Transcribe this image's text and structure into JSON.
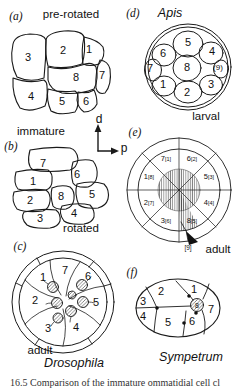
{
  "panel_a": {
    "tag": "(a)",
    "title": "pre-rotated",
    "cells": {
      "n1": "1",
      "n2": "2",
      "n3": "3",
      "n4": "4",
      "n5": "5",
      "n6": "6",
      "n7": "7",
      "n8": "8"
    }
  },
  "axis": {
    "d": "d",
    "p": "p"
  },
  "panel_b": {
    "tag": "(b)",
    "title": "immature",
    "state_label": "rotated",
    "cells": {
      "n1": "1",
      "n2": "2",
      "n3": "3",
      "n4": "4",
      "n5": "5",
      "n6": "6",
      "n7": "7",
      "n8": "8"
    }
  },
  "panel_c": {
    "tag": "(c)",
    "state_label": "adult",
    "species": "Drosophila",
    "cells": {
      "n1": "1",
      "n2": "2",
      "n3": "3",
      "n4": "4",
      "n5": "5",
      "n6": "6",
      "n7": "7"
    }
  },
  "panel_d": {
    "tag": "(d)",
    "species": "Apis",
    "state_label": "larval",
    "cells": {
      "n1": "1",
      "n2": "2",
      "n3": "3",
      "n4": "4",
      "n5": "5",
      "n6": "6",
      "n7": "7",
      "n8": "8",
      "n9": "(9)"
    }
  },
  "panel_e": {
    "tag": "(e)",
    "state_label": "adult",
    "pointer_label": "[9]",
    "sectors": [
      {
        "cell": "7",
        "map": "[1]"
      },
      {
        "cell": "6",
        "map": "[2]"
      },
      {
        "cell": "5",
        "map": "[3]"
      },
      {
        "cell": "4",
        "map": "[4]"
      },
      {
        "cell": "8",
        "map": "[5]"
      },
      {
        "cell": "3",
        "map": "[6]"
      },
      {
        "cell": "2",
        "map": "[7]"
      },
      {
        "cell": "1",
        "map": "[8]"
      }
    ]
  },
  "panel_f": {
    "tag": "(f)",
    "species": "Sympetrum",
    "cells": {
      "n1": "1",
      "n2": "2",
      "n3": "3",
      "n4": "4",
      "n5": "5",
      "n6": "6",
      "n7": "7",
      "n8": "8"
    }
  },
  "caption": {
    "partial": "16.5 Comparison of the immature ommatidial cell cl"
  }
}
